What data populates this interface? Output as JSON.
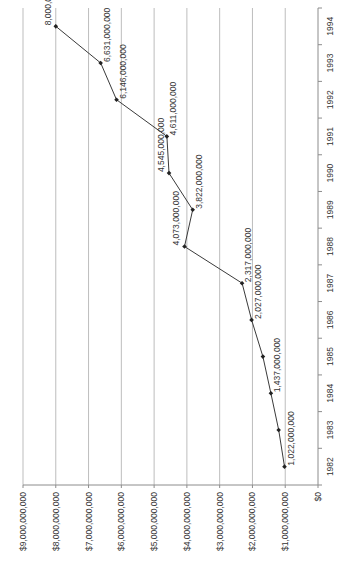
{
  "colors": {
    "background": "#ffffff",
    "gridline": "#bdbdbd",
    "axis": "#8c8c8c",
    "series_line": "#3a3a3a",
    "marker": "#222222",
    "text": "#333333"
  },
  "chart_data": {
    "type": "line",
    "orientation": "rotated-90",
    "title": "",
    "xlabel": "",
    "ylabel": "",
    "categories": [
      "1982",
      "1983",
      "1984",
      "1985",
      "1986",
      "1987",
      "1988",
      "1989",
      "1990",
      "1991",
      "1992",
      "1993",
      "1994"
    ],
    "series": [
      {
        "name": "Value",
        "values": [
          1022000000,
          1200000000,
          1437000000,
          1680000000,
          2027000000,
          2317000000,
          4073000000,
          3822000000,
          4545000000,
          4611000000,
          6146000000,
          6631000000,
          8000000000
        ]
      }
    ],
    "data_labels": [
      {
        "category": "1982",
        "text": "1,022,000,000",
        "side": "right"
      },
      {
        "category": "1984",
        "text": "1,437,000,000",
        "side": "right"
      },
      {
        "category": "1986",
        "text": "2,027,000,000",
        "side": "right"
      },
      {
        "category": "1987",
        "text": "2,317,000,000",
        "side": "right"
      },
      {
        "category": "1988",
        "text": "4,073,000,000",
        "side": "left"
      },
      {
        "category": "1989",
        "text": "3,822,000,000",
        "side": "right"
      },
      {
        "category": "1990",
        "text": "4,545,000,000",
        "side": "left"
      },
      {
        "category": "1991",
        "text": "4,611,000,000",
        "side": "right"
      },
      {
        "category": "1992",
        "text": "6,146,000,000",
        "side": "right"
      },
      {
        "category": "1993",
        "text": "6,631,000,000",
        "side": "right"
      },
      {
        "category": "1994",
        "text": "8,000,000,000",
        "side": "left"
      }
    ],
    "value_axis": {
      "ylim": [
        0,
        9000000000
      ],
      "ticks": [
        0,
        1000000000,
        2000000000,
        3000000000,
        4000000000,
        5000000000,
        6000000000,
        7000000000,
        8000000000,
        9000000000
      ],
      "tick_labels": [
        "$0",
        "$1,000,000,000",
        "$2,000,000,000",
        "$3,000,000,000",
        "$4,000,000,000",
        "$5,000,000,000",
        "$6,000,000,000",
        "$7,000,000,000",
        "$8,000,000,000",
        "$9,000,000,000"
      ]
    },
    "grid": true,
    "legend": "none"
  }
}
